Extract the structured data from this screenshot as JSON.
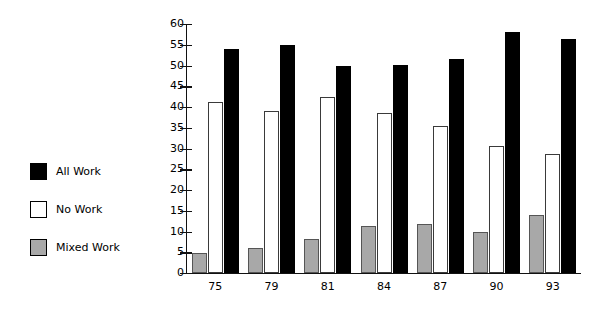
{
  "chart_data": {
    "type": "bar",
    "title": "",
    "subtitle": "",
    "xlabel": "",
    "ylabel": "",
    "categories": [
      "75",
      "79",
      "81",
      "84",
      "87",
      "90",
      "93"
    ],
    "ylim": [
      0,
      60
    ],
    "ytick_step": 5,
    "yticks": [
      "60",
      "55",
      "50",
      "45",
      "40",
      "35",
      "30",
      "25",
      "20",
      "15",
      "10",
      "5",
      "0"
    ],
    "grid": false,
    "legend_position": "left",
    "series": [
      {
        "name": "All Work",
        "color": "#000000",
        "swatch": "solid-black",
        "values": [
          54,
          55,
          50,
          50.2,
          51.6,
          58,
          56.5
        ]
      },
      {
        "name": "No Work",
        "color": "#ffffff",
        "swatch": "outlined-white",
        "values": [
          41.2,
          39,
          42.5,
          38.5,
          35.4,
          30.7,
          28.7
        ]
      },
      {
        "name": "Mixed Work",
        "color": "#a8a8a8",
        "swatch": "solid-gray",
        "values": [
          4.8,
          6,
          8.3,
          11.3,
          11.8,
          10,
          14
        ]
      }
    ],
    "draw_order": [
      "Mixed Work",
      "No Work",
      "All Work"
    ]
  },
  "legend": {
    "items": [
      {
        "label": "All Work",
        "swatch": "solid-black"
      },
      {
        "label": "No Work",
        "swatch": "outlined-white"
      },
      {
        "label": "Mixed Work",
        "swatch": "solid-gray"
      }
    ]
  }
}
